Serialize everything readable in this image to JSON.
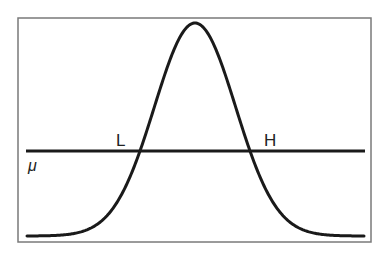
{
  "diagram": {
    "frame": {
      "x": 18,
      "y": 18,
      "width": 353,
      "height": 224,
      "stroke": "#7a7a7a"
    },
    "curve": {
      "type": "gaussian",
      "center_x": 195,
      "peak_y": 23,
      "baseline_y": 236,
      "sigma_px": 40.6,
      "x_start": 27,
      "x_end": 364,
      "stroke": "#1a1a1a",
      "stroke_width": 3
    },
    "mean_line": {
      "y": 151,
      "x_start": 26,
      "x_end": 365,
      "stroke": "#1a1a1a",
      "stroke_width": 3
    },
    "labels": {
      "low": "L",
      "high": "H",
      "mean": "μ"
    },
    "label_positions": {
      "low": {
        "x": 116,
        "y": 146
      },
      "high": {
        "x": 264,
        "y": 146
      },
      "mean": {
        "x": 28,
        "y": 171
      }
    },
    "intersections": [
      {
        "name": "L",
        "x": 139,
        "y": 151
      },
      {
        "name": "H",
        "x": 250,
        "y": 151
      }
    ]
  }
}
